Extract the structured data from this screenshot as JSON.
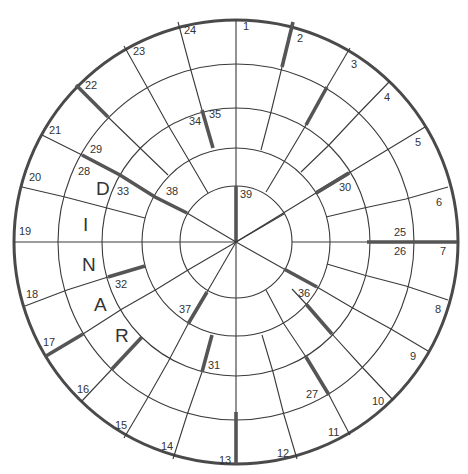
{
  "puzzle": {
    "type": "circular-spiral-crossword",
    "colors": {
      "line": "#3a3a3a",
      "thick_bar": "#555555",
      "background": "#ffffff",
      "text": "#333333"
    },
    "entered_word": "DINAR",
    "entered_letters": [
      {
        "letter": "D",
        "x": 96,
        "y": 195
      },
      {
        "letter": "I",
        "x": 83,
        "y": 231
      },
      {
        "letter": "N",
        "x": 82,
        "y": 271
      },
      {
        "letter": "A",
        "x": 94,
        "y": 311
      },
      {
        "letter": "R",
        "x": 115,
        "y": 342
      }
    ],
    "clue_numbers": [
      {
        "n": "1",
        "x": 243,
        "y": 30
      },
      {
        "n": "2",
        "x": 297,
        "y": 42
      },
      {
        "n": "3",
        "x": 351,
        "y": 68
      },
      {
        "n": "4",
        "x": 384,
        "y": 101
      },
      {
        "n": "5",
        "x": 415,
        "y": 146
      },
      {
        "n": "6",
        "x": 436,
        "y": 206
      },
      {
        "n": "7",
        "x": 440,
        "y": 255
      },
      {
        "n": "8",
        "x": 435,
        "y": 313
      },
      {
        "n": "9",
        "x": 410,
        "y": 360
      },
      {
        "n": "10",
        "x": 372,
        "y": 405
      },
      {
        "n": "11",
        "x": 328,
        "y": 436
      },
      {
        "n": "12",
        "x": 277,
        "y": 457
      },
      {
        "n": "13",
        "x": 219,
        "y": 464
      },
      {
        "n": "14",
        "x": 161,
        "y": 450
      },
      {
        "n": "15",
        "x": 115,
        "y": 429
      },
      {
        "n": "16",
        "x": 77,
        "y": 393
      },
      {
        "n": "17",
        "x": 43,
        "y": 346
      },
      {
        "n": "18",
        "x": 26,
        "y": 298
      },
      {
        "n": "19",
        "x": 19,
        "y": 235
      },
      {
        "n": "20",
        "x": 29,
        "y": 181
      },
      {
        "n": "21",
        "x": 49,
        "y": 134
      },
      {
        "n": "22",
        "x": 85,
        "y": 89
      },
      {
        "n": "23",
        "x": 133,
        "y": 55
      },
      {
        "n": "24",
        "x": 184,
        "y": 34
      },
      {
        "n": "25",
        "x": 394,
        "y": 236
      },
      {
        "n": "26",
        "x": 394,
        "y": 255
      },
      {
        "n": "27",
        "x": 306,
        "y": 398
      },
      {
        "n": "28",
        "x": 78,
        "y": 175
      },
      {
        "n": "29",
        "x": 90,
        "y": 153
      },
      {
        "n": "30",
        "x": 339,
        "y": 191
      },
      {
        "n": "31",
        "x": 208,
        "y": 369
      },
      {
        "n": "32",
        "x": 115,
        "y": 288
      },
      {
        "n": "33",
        "x": 117,
        "y": 195
      },
      {
        "n": "34",
        "x": 189,
        "y": 125
      },
      {
        "n": "35",
        "x": 209,
        "y": 118
      },
      {
        "n": "36",
        "x": 298,
        "y": 297
      },
      {
        "n": "37",
        "x": 179,
        "y": 313
      },
      {
        "n": "38",
        "x": 166,
        "y": 195
      },
      {
        "n": "39",
        "x": 240,
        "y": 198
      }
    ]
  }
}
